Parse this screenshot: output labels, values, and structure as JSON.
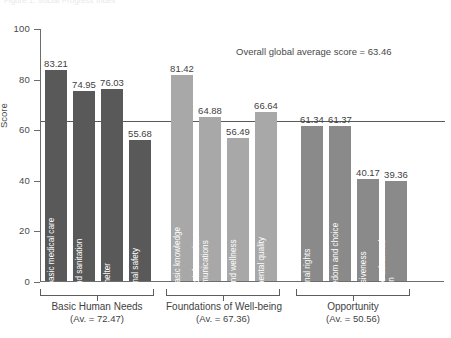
{
  "figure": {
    "ghost_header": "Figure 1. Social Progress Index",
    "annotation": "Overall global average score = 63.46",
    "average_value": 63.46
  },
  "chart_data": {
    "type": "bar",
    "title": "",
    "xlabel": "",
    "ylabel": "Score",
    "ylim": [
      0,
      100
    ],
    "yticks": [
      0,
      20,
      40,
      60,
      80,
      100
    ],
    "ytick_labels": [
      "0",
      "20",
      "40",
      "60",
      "80",
      "100"
    ],
    "grid": false,
    "legend": "none",
    "annotations": [
      {
        "text": "Overall global average score = 63.46",
        "value": 63.46,
        "type": "hline-label"
      }
    ],
    "categories": [
      "Nutrition and basic medical care",
      "Water and sanitation",
      "Shelter",
      "Personal safety",
      "Access to basic knowledge",
      "Access to information and communications",
      "Health and wellness",
      "Environmental quality",
      "Personal rights",
      "Personal freedom and choice",
      "Inclusiveness",
      "Access to advanced education"
    ],
    "values": [
      83.21,
      74.95,
      76.03,
      55.68,
      81.42,
      64.88,
      56.49,
      66.64,
      61.34,
      61.37,
      40.17,
      39.36
    ],
    "value_labels": [
      "83.21",
      "74.95",
      "76.03",
      "55.68",
      "81.42",
      "64.88",
      "56.49",
      "66.64",
      "61.34",
      "61.37",
      "40.17",
      "39.36"
    ],
    "groups": [
      {
        "name": "Basic Human Needs",
        "average_label": "(Av. = 72.47)",
        "average": 72.47,
        "color": "#595959",
        "indices": [
          0,
          1,
          2,
          3
        ]
      },
      {
        "name": "Foundations of Well-being",
        "average_label": "(Av. = 67.36)",
        "average": 67.36,
        "color": "#a8a8a8",
        "indices": [
          4,
          5,
          6,
          7
        ]
      },
      {
        "name": "Opportunity",
        "average_label": "(Av. = 50.56)",
        "average": 50.56,
        "color": "#8a8a8a",
        "indices": [
          8,
          9,
          10,
          11
        ]
      }
    ]
  },
  "colors": {
    "group1": "#595959",
    "group2": "#a8a8a8",
    "group3": "#8a8a8a",
    "axis": "#6d6d6d",
    "text": "#3f3f3f",
    "background": "#ffffff"
  }
}
